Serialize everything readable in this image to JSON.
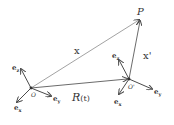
{
  "diagram": {
    "colors": {
      "line": "#4a4a4a",
      "text": "#333333",
      "background": "#ffffff"
    },
    "points": {
      "origin": {
        "label": "O",
        "x": 31,
        "y": 88
      },
      "origin_prime": {
        "label": "O'",
        "x": 129,
        "y": 79
      },
      "p": {
        "label": "P",
        "x": 140,
        "y": 18
      }
    },
    "vectors": [
      {
        "id": "x",
        "label": "x",
        "from": "origin",
        "to": "p"
      },
      {
        "id": "R",
        "label_main": "R",
        "label_arg": "(t)",
        "from": "origin",
        "to": "origin_prime"
      },
      {
        "id": "x_prime",
        "label": "x'",
        "from": "origin_prime",
        "to": "p"
      }
    ],
    "frame_origin_axes": {
      "ez": {
        "label_base": "e",
        "label_sub": "z"
      },
      "ey": {
        "label_base": "e",
        "label_sub": "y"
      },
      "ex": {
        "label_base": "e",
        "label_sub": "x"
      }
    },
    "frame_prime_axes": {
      "ez": {
        "label_base": "e",
        "label_sub": "z"
      },
      "ey": {
        "label_base": "e",
        "label_sub": "y"
      },
      "ex": {
        "label_base": "e",
        "label_sub": "x"
      }
    }
  }
}
